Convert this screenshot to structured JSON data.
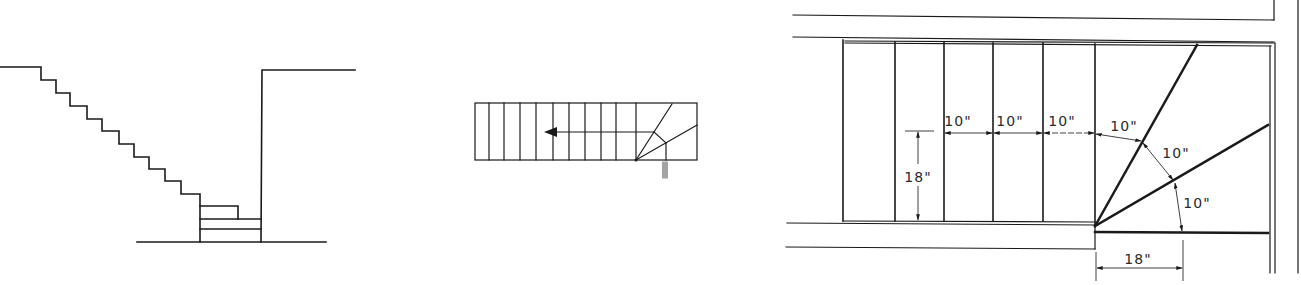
{
  "figures": [
    {
      "id": "elevation",
      "title": "Stair elevation (section)",
      "description": "Straight-run stair descending to winder steps at bottom landing against wall"
    },
    {
      "id": "plan-small",
      "title": "Stair plan with winders",
      "description": "Plan view with direction arrow and three winder treads at the corner"
    },
    {
      "id": "plan-detail",
      "title": "Winder layout detail",
      "labels": {
        "tread_1": "10\"",
        "tread_2": "10\"",
        "tread_3": "10\"",
        "winder_1": "10\"",
        "winder_2": "10\"",
        "winder_3": "10\"",
        "walkline_offset_vertical": "18\"",
        "walkline_offset_horizontal": "18\""
      }
    }
  ],
  "colors": {
    "line": "#1a1a1a",
    "background": "#ffffff"
  }
}
